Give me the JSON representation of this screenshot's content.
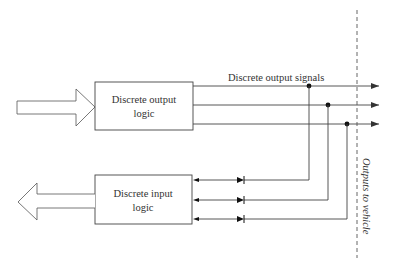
{
  "diagram": {
    "output_block": {
      "label_line1": "Discrete output",
      "label_line2": "logic"
    },
    "input_block": {
      "label_line1": "Discrete input",
      "label_line2": "logic"
    },
    "signals_label": "Discrete output signals",
    "boundary_label": "Outputs to vehicle",
    "output_signal_count": 3,
    "input_signal_count": 3,
    "colors": {
      "line": "#444444",
      "dash": "#555555",
      "text": "#333333",
      "background": "#ffffff"
    }
  }
}
